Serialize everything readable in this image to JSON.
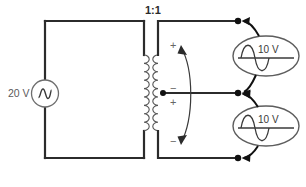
{
  "diagram": {
    "transformer": {
      "ratio_label": "1:1",
      "primary_turns_drawn": 9,
      "secondary_turns_drawn": 9,
      "center_tapped": true
    },
    "source": {
      "label": "20 V",
      "symbol": "ac-source-sine",
      "position": "left-branch"
    },
    "meters": [
      {
        "id": "upper",
        "label": "10 V",
        "symbol": "ac-voltmeter-sine",
        "measures": "top-half-of-secondary"
      },
      {
        "id": "lower",
        "label": "10 V",
        "symbol": "ac-voltmeter-sine",
        "measures": "bottom-half-of-secondary"
      }
    ],
    "polarity_marks": [
      {
        "id": "top-plus",
        "sign": "+"
      },
      {
        "id": "mid-minus",
        "sign": "−"
      },
      {
        "id": "mid-plus",
        "sign": "+"
      },
      {
        "id": "bottom-minus",
        "sign": "−"
      }
    ],
    "nodes": [
      {
        "id": "top-terminal"
      },
      {
        "id": "center-tap-terminal"
      },
      {
        "id": "bottom-terminal"
      },
      {
        "id": "center-tap-coil"
      }
    ],
    "colors": {
      "wire": "#2b2b2b",
      "coil": "#555555",
      "text": "#4a4a4a",
      "background": "#ffffff"
    }
  }
}
